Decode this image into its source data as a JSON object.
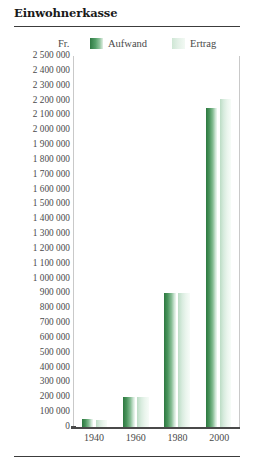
{
  "header": {
    "title": "Einwohnerkasse"
  },
  "legend": {
    "unit": "Fr.",
    "items": [
      {
        "label": "Aufwand",
        "color": "#2d7840",
        "swatch": "aufwand-swatch"
      },
      {
        "label": "Ertrag",
        "color": "#cfe7d5",
        "swatch": "ertrag-swatch"
      }
    ]
  },
  "chart_data": {
    "type": "bar",
    "title": "Einwohnerkasse",
    "xlabel": "",
    "ylabel": "Fr.",
    "categories": [
      "1940",
      "1960",
      "1980",
      "2000"
    ],
    "series": [
      {
        "name": "Aufwand",
        "values": [
          55000,
          205000,
          900000,
          2150000
        ]
      },
      {
        "name": "Ertrag",
        "values": [
          50000,
          200000,
          900000,
          2210000
        ]
      }
    ],
    "ylim": [
      0,
      2500000
    ],
    "ytick_step": 100000,
    "ytick_labels": [
      "2 500 000",
      "2 400 000",
      "2 300 000",
      "2 200 000",
      "2 100 000",
      "2 000 000",
      "1 900 000",
      "1 800 000",
      "1 700 000",
      "1 600 000",
      "1 500 000",
      "1 400 000",
      "1 300 000",
      "1 200 000",
      "1 100 000",
      "1 000 000",
      "900 000",
      "800 000",
      "700 000",
      "600 000",
      "500 000",
      "400 000",
      "300 000",
      "200 000",
      "100 000",
      "0"
    ],
    "ytick_values": [
      2500000,
      2400000,
      2300000,
      2200000,
      2100000,
      2000000,
      1900000,
      1800000,
      1700000,
      1600000,
      1500000,
      1400000,
      1300000,
      1200000,
      1100000,
      1000000,
      900000,
      800000,
      700000,
      600000,
      500000,
      400000,
      300000,
      200000,
      100000,
      0
    ],
    "grid": false,
    "legend_position": "top"
  }
}
